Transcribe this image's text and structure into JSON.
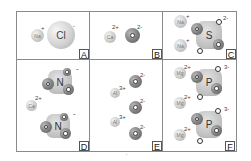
{
  "diagram": {
    "title": "",
    "panels": [
      {
        "label": "A",
        "compound": "NaCl",
        "ions": [
          {
            "symbol": "Na",
            "charge": "+"
          },
          {
            "symbol": "Cl",
            "charge": "-"
          }
        ]
      },
      {
        "label": "B",
        "compound": "CaO",
        "ions": [
          {
            "symbol": "Ca",
            "charge": "2+"
          },
          {
            "symbol": "O",
            "charge": "2-"
          }
        ]
      },
      {
        "label": "C",
        "compound": "Na2SO4",
        "ions": [
          {
            "symbol": "Na",
            "charge": "+"
          },
          {
            "symbol": "Na",
            "charge": "+"
          },
          {
            "symbol": "S",
            "charge": "2-",
            "group": "SO4"
          }
        ]
      },
      {
        "label": "D",
        "compound": "Ca(NO3)2",
        "ions": [
          {
            "symbol": "Ca",
            "charge": "2+"
          },
          {
            "symbol": "N",
            "charge": "-",
            "group": "NO3"
          },
          {
            "symbol": "N",
            "charge": "-",
            "group": "NO3"
          }
        ]
      },
      {
        "label": "E",
        "compound": "Al2O3",
        "ions": [
          {
            "symbol": "Al",
            "charge": "3+"
          },
          {
            "symbol": "Al",
            "charge": "3+"
          },
          {
            "symbol": "O",
            "charge": "2-"
          },
          {
            "symbol": "O",
            "charge": "2-"
          },
          {
            "symbol": "O",
            "charge": "2-"
          }
        ]
      },
      {
        "label": "F",
        "compound": "Mg3(PO4)2",
        "ions": [
          {
            "symbol": "Mg",
            "charge": "2+"
          },
          {
            "symbol": "Mg",
            "charge": "2+"
          },
          {
            "symbol": "Mg",
            "charge": "2+"
          },
          {
            "symbol": "P",
            "charge": "3-",
            "group": "PO4"
          },
          {
            "symbol": "P",
            "charge": "3-",
            "group": "PO4"
          }
        ]
      }
    ],
    "footer_mark": "'"
  }
}
